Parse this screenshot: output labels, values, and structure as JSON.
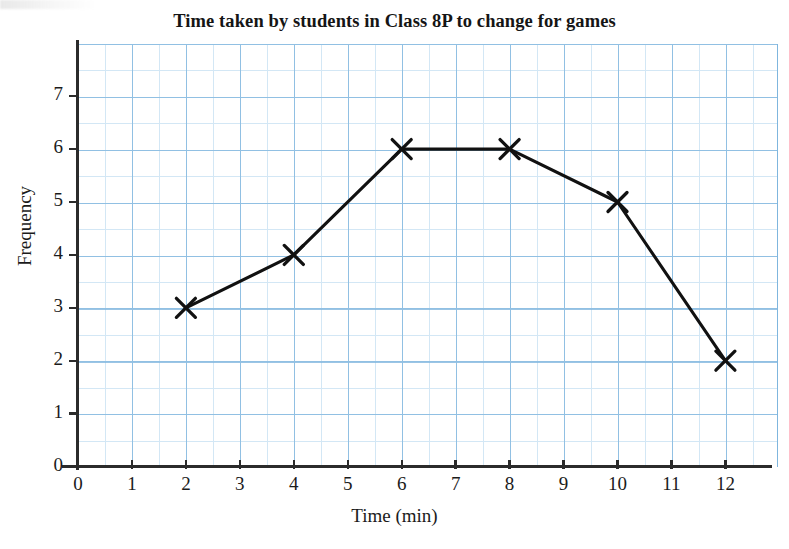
{
  "chart_data": {
    "type": "line",
    "title": "Time taken by students in Class 8P to change for games",
    "xlabel": "Time (min)",
    "ylabel": "Frequency",
    "x": [
      2,
      4,
      6,
      8,
      10,
      12
    ],
    "values": [
      3,
      4,
      6,
      6,
      5,
      2
    ],
    "series": [
      {
        "name": "Frequency",
        "marker": "cross",
        "line_color": "#111111",
        "points": [
          {
            "x": 2,
            "y": 3
          },
          {
            "x": 4,
            "y": 4
          },
          {
            "x": 6,
            "y": 6
          },
          {
            "x": 8,
            "y": 6
          },
          {
            "x": 10,
            "y": 5
          },
          {
            "x": 12,
            "y": 2
          }
        ]
      }
    ],
    "xlim": [
      0,
      13
    ],
    "ylim": [
      0,
      8
    ],
    "x_ticks": [
      "0",
      "1",
      "2",
      "3",
      "4",
      "5",
      "6",
      "7",
      "8",
      "9",
      "10",
      "11",
      "12"
    ],
    "y_ticks": [
      "0",
      "1",
      "2",
      "3",
      "4",
      "5",
      "6",
      "7"
    ],
    "grid": true,
    "grid_minor_step": 0.5,
    "grid_major_step": 1,
    "grid_color": "#7fb6de",
    "grid_minor_color": "#b9d9f0",
    "legend": "none"
  },
  "axes": {
    "x_labels": [
      "0",
      "1",
      "2",
      "3",
      "4",
      "5",
      "6",
      "7",
      "8",
      "9",
      "10",
      "11",
      "12"
    ],
    "y_labels": [
      "0",
      "1",
      "2",
      "3",
      "4",
      "5",
      "6",
      "7"
    ],
    "x_title": "Time (min)",
    "y_title": "Frequency"
  },
  "header": {
    "title": "Time taken by students in Class 8P to change for games"
  }
}
